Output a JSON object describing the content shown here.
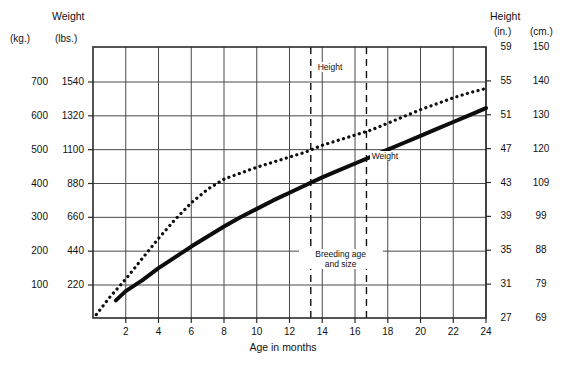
{
  "chart_data": {
    "type": "line",
    "title": "",
    "xlabel": "Age in months",
    "x_ticks": [
      2,
      4,
      6,
      8,
      10,
      12,
      14,
      16,
      18,
      20,
      22,
      24
    ],
    "xlim": [
      0,
      24
    ],
    "grid": true,
    "legend_position": "inline-annotations",
    "axes": {
      "left": {
        "primary_unit": "kg.",
        "secondary_unit": "lbs.",
        "title": "Weight",
        "kg_ticks": [
          100,
          200,
          300,
          400,
          500,
          600,
          700
        ],
        "lbs_ticks": [
          220,
          440,
          660,
          880,
          1100,
          1320,
          1540
        ],
        "ylim_lbs": [
          0,
          1760
        ]
      },
      "right": {
        "primary_unit": "in.",
        "secondary_unit": "cm.",
        "title": "Height",
        "in_ticks": [
          27,
          31,
          35,
          39,
          43,
          47,
          51,
          55,
          59
        ],
        "cm_ticks": [
          69,
          79,
          88,
          99,
          109,
          120,
          130,
          140,
          150
        ],
        "ylim_in": [
          27,
          59
        ]
      }
    },
    "series": [
      {
        "name": "Weight",
        "style": "solid-thick",
        "unit": "lbs.",
        "points": [
          [
            1.4,
            120
          ],
          [
            2,
            180
          ],
          [
            3,
            250
          ],
          [
            4,
            330
          ],
          [
            5,
            400
          ],
          [
            6,
            470
          ],
          [
            7,
            535
          ],
          [
            8,
            600
          ],
          [
            9,
            660
          ],
          [
            10,
            715
          ],
          [
            11,
            770
          ],
          [
            12,
            820
          ],
          [
            13,
            870
          ],
          [
            14,
            920
          ],
          [
            15,
            965
          ],
          [
            16,
            1010
          ],
          [
            17,
            1055
          ],
          [
            18,
            1100
          ],
          [
            19,
            1145
          ],
          [
            20,
            1190
          ],
          [
            21,
            1235
          ],
          [
            22,
            1280
          ],
          [
            23,
            1325
          ],
          [
            24,
            1370
          ]
        ]
      },
      {
        "name": "Height",
        "style": "dotted",
        "unit": "in.",
        "points": [
          [
            0.2,
            27.4
          ],
          [
            1,
            29.4
          ],
          [
            2,
            31.6
          ],
          [
            3,
            34.0
          ],
          [
            4,
            36.4
          ],
          [
            5,
            38.6
          ],
          [
            6,
            40.6
          ],
          [
            7,
            42.2
          ],
          [
            8,
            43.4
          ],
          [
            9,
            44.1
          ],
          [
            10,
            44.8
          ],
          [
            11,
            45.4
          ],
          [
            12,
            46.0
          ],
          [
            13,
            46.6
          ],
          [
            14,
            47.4
          ],
          [
            15,
            48.0
          ],
          [
            16,
            48.6
          ],
          [
            17,
            49.2
          ],
          [
            18,
            50.0
          ],
          [
            19,
            50.8
          ],
          [
            20,
            51.6
          ],
          [
            21,
            52.3
          ],
          [
            22,
            53.0
          ],
          [
            23,
            53.6
          ],
          [
            24,
            54.1
          ]
        ]
      }
    ],
    "markers": [
      {
        "name": "breeding-age-start",
        "x": 13.3,
        "style": "dashed-vertical"
      },
      {
        "name": "breeding-age-end",
        "x": 16.7,
        "style": "dashed-vertical"
      }
    ],
    "annotations": [
      {
        "name": "height-series-label",
        "text": "Height",
        "x": 14.7,
        "y_in": 56.6
      },
      {
        "name": "weight-series-label",
        "text": "Weight",
        "x": 18.0,
        "y_lbs": 1060
      },
      {
        "name": "breeding-range-label",
        "text": "Breeding age\nand size",
        "x": 15.0,
        "y_lbs": 390
      }
    ]
  },
  "header": {
    "left_unit": "(kg.)",
    "left_title": "Weight",
    "left_subunit": "(lbs.)",
    "right_title": "Height",
    "right_unit": "(in.)",
    "right_subunit": "(cm.)"
  },
  "annotations": {
    "height_label": "Height",
    "weight_label": "Weight",
    "breeding_line1": "Breeding age",
    "breeding_line2": "and size"
  },
  "colors": {
    "ink": "#111111",
    "grid": "#4a4a4a",
    "frame": "#2b2b2b",
    "background": "#ffffff"
  }
}
